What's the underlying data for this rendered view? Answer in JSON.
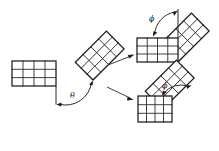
{
  "figure": {
    "background_color": "#ffffff",
    "line_color": "#2b2b2b",
    "width": 219,
    "height": 151
  },
  "labels": {
    "theta": "θ",
    "phi_top": "ϕ",
    "phi_bottom": "ϕ"
  },
  "panels": {
    "source_grid": {
      "name": "original-grid",
      "columns": 4,
      "rows": 3,
      "rotation_deg": 0
    },
    "rotated_grid": {
      "name": "theta-rotated-grid",
      "columns": 4,
      "rows": 3,
      "rotation_deg": -45
    },
    "top_result": {
      "name": "top-result",
      "base_grid": {
        "columns": 4,
        "rows": 3,
        "rotation_deg": 0
      },
      "attached_grid": {
        "columns": 4,
        "rows": 3,
        "rotation_deg": -45
      },
      "angle_label": "ϕ"
    },
    "bottom_result": {
      "name": "bottom-result",
      "base_grid": {
        "columns": 4,
        "rows": 3,
        "rotation_deg": 0
      },
      "attached_grid": {
        "columns": 4,
        "rows": 3,
        "rotation_deg": -45
      },
      "angle_label": "ϕ"
    }
  },
  "arrows": {
    "to_top": "branch-arrow-up",
    "to_bottom": "branch-arrow-down"
  }
}
